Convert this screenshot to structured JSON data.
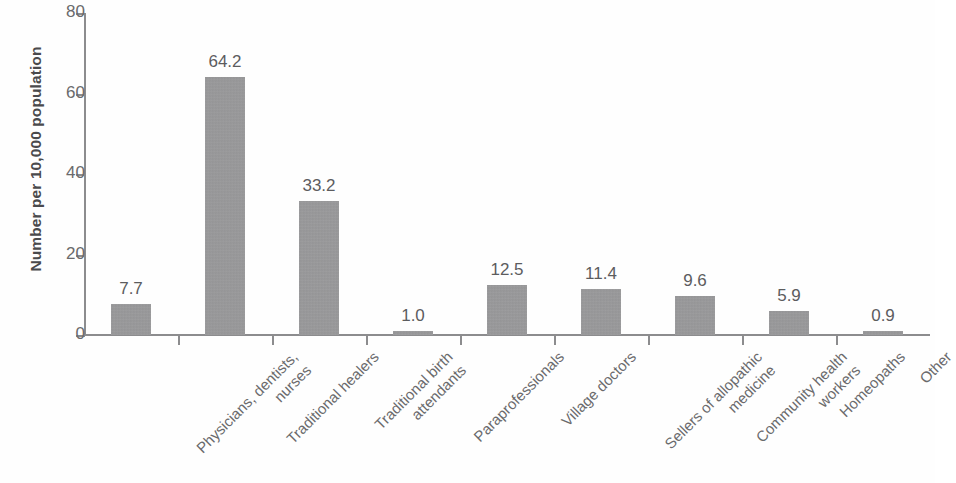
{
  "chart_data": {
    "type": "bar",
    "title": "",
    "subtitle": "",
    "xlabel": "",
    "ylabel": "Number per 10,000 population",
    "ylim": [
      0,
      80
    ],
    "yticks": [
      0,
      20,
      40,
      60,
      80
    ],
    "ytick_labels": [
      "0",
      "20",
      "40",
      "60",
      "80"
    ],
    "grid": false,
    "legend": null,
    "bar_color": "#939395",
    "categories": [
      "Physicians, dentists, nurses",
      "Traditional healers",
      "Traditional birth attendants",
      "Paraprofessionals",
      "Village doctors",
      "Sellers of allopathic medicine",
      "Community health workers",
      "Homeopaths",
      "Other"
    ],
    "category_lines": [
      [
        "Physicians, dentists,",
        "nurses"
      ],
      [
        "Traditional healers"
      ],
      [
        "Traditional birth",
        "attendants"
      ],
      [
        "Paraprofessionals"
      ],
      [
        "Village doctors"
      ],
      [
        "Sellers of allopathic",
        "medicine"
      ],
      [
        "Community health",
        "workers"
      ],
      [
        "Homeopaths"
      ],
      [
        "Other"
      ]
    ],
    "values": [
      7.7,
      64.2,
      33.2,
      1.0,
      12.5,
      11.4,
      9.6,
      5.9,
      0.9
    ],
    "value_labels": [
      "7.7",
      "64.2",
      "33.2",
      "1.0",
      "12.5",
      "11.4",
      "9.6",
      "5.9",
      "0.9"
    ]
  }
}
